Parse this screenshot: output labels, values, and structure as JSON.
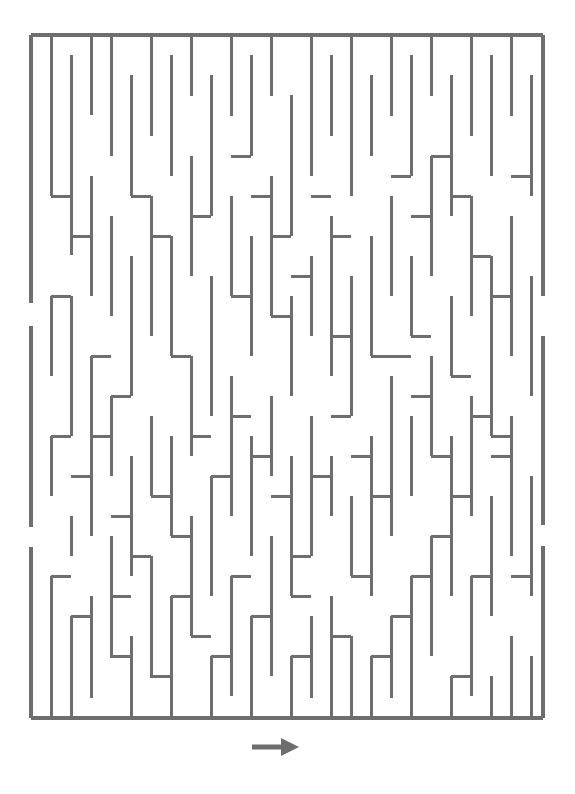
{
  "page": {
    "background_color": "#ffffff",
    "width": 575,
    "height": 794
  },
  "maze": {
    "name": "vertical-corridor-maze",
    "wall_color": "#6e6e6e",
    "wall_thickness": 3,
    "border_thickness": 4,
    "cell_size": 20,
    "columns": 26,
    "rows": 34,
    "origin_x": 31,
    "origin_y": 35,
    "width": 512,
    "height": 683,
    "border_segments": [
      {
        "name": "top-border",
        "x1": 31,
        "y1": 35,
        "x2": 543,
        "y2": 35
      },
      {
        "name": "bottom-border",
        "x1": 31,
        "y1": 718,
        "x2": 543,
        "y2": 718
      },
      {
        "name": "left-border-upper",
        "x1": 31,
        "y1": 35,
        "x2": 31,
        "y2": 303
      },
      {
        "name": "left-border-middle",
        "x1": 31,
        "y1": 326,
        "x2": 31,
        "y2": 527
      },
      {
        "name": "left-border-lower",
        "x1": 31,
        "y1": 547,
        "x2": 31,
        "y2": 718
      },
      {
        "name": "right-border-upper",
        "x1": 543,
        "y1": 35,
        "x2": 543,
        "y2": 296
      },
      {
        "name": "right-border-middle",
        "x1": 543,
        "y1": 336,
        "x2": 543,
        "y2": 525
      },
      {
        "name": "right-border-lower",
        "x1": 543,
        "y1": 546,
        "x2": 543,
        "y2": 718
      }
    ],
    "vertical_walls": [
      [
        51,
        35,
        51,
        196
      ],
      [
        51,
        296,
        51,
        376
      ],
      [
        51,
        436,
        51,
        496
      ],
      [
        51,
        576,
        51,
        718
      ],
      [
        71,
        55,
        71,
        255
      ],
      [
        71,
        296,
        71,
        436
      ],
      [
        71,
        516,
        71,
        556
      ],
      [
        71,
        616,
        71,
        718
      ],
      [
        91,
        35,
        91,
        115
      ],
      [
        91,
        176,
        91,
        296
      ],
      [
        91,
        356,
        91,
        536
      ],
      [
        91,
        596,
        91,
        698
      ],
      [
        111,
        35,
        111,
        156
      ],
      [
        111,
        216,
        111,
        316
      ],
      [
        111,
        396,
        111,
        476
      ],
      [
        111,
        536,
        111,
        658
      ],
      [
        131,
        75,
        131,
        196
      ],
      [
        131,
        256,
        131,
        396
      ],
      [
        131,
        456,
        131,
        576
      ],
      [
        131,
        636,
        131,
        718
      ],
      [
        151,
        35,
        151,
        136
      ],
      [
        151,
        196,
        151,
        336
      ],
      [
        151,
        416,
        151,
        496
      ],
      [
        151,
        556,
        151,
        678
      ],
      [
        171,
        55,
        171,
        176
      ],
      [
        171,
        236,
        171,
        356
      ],
      [
        171,
        436,
        171,
        536
      ],
      [
        171,
        596,
        171,
        718
      ],
      [
        191,
        35,
        191,
        96
      ],
      [
        191,
        156,
        191,
        276
      ],
      [
        191,
        356,
        191,
        456
      ],
      [
        191,
        516,
        191,
        636
      ],
      [
        211,
        75,
        211,
        216
      ],
      [
        211,
        276,
        211,
        416
      ],
      [
        211,
        476,
        211,
        596
      ],
      [
        211,
        656,
        211,
        718
      ],
      [
        231,
        35,
        231,
        116
      ],
      [
        231,
        196,
        231,
        296
      ],
      [
        231,
        376,
        231,
        516
      ],
      [
        231,
        576,
        231,
        696
      ],
      [
        251,
        55,
        251,
        156
      ],
      [
        251,
        236,
        251,
        356
      ],
      [
        251,
        436,
        251,
        556
      ],
      [
        251,
        616,
        251,
        718
      ],
      [
        271,
        35,
        271,
        96
      ],
      [
        271,
        176,
        271,
        316
      ],
      [
        271,
        396,
        271,
        476
      ],
      [
        271,
        536,
        271,
        676
      ],
      [
        291,
        95,
        291,
        236
      ],
      [
        291,
        296,
        291,
        396
      ],
      [
        291,
        456,
        291,
        596
      ],
      [
        291,
        656,
        291,
        718
      ],
      [
        311,
        35,
        311,
        176
      ],
      [
        311,
        256,
        311,
        336
      ],
      [
        311,
        416,
        311,
        556
      ],
      [
        311,
        616,
        311,
        698
      ],
      [
        331,
        55,
        331,
        136
      ],
      [
        331,
        216,
        331,
        376
      ],
      [
        331,
        456,
        331,
        516
      ],
      [
        331,
        596,
        331,
        718
      ],
      [
        351,
        35,
        351,
        196
      ],
      [
        351,
        276,
        351,
        416
      ],
      [
        351,
        496,
        351,
        576
      ],
      [
        351,
        636,
        351,
        718
      ],
      [
        371,
        75,
        371,
        156
      ],
      [
        371,
        236,
        371,
        356
      ],
      [
        371,
        436,
        371,
        596
      ],
      [
        371,
        656,
        371,
        718
      ],
      [
        391,
        35,
        391,
        116
      ],
      [
        391,
        196,
        391,
        296
      ],
      [
        391,
        376,
        391,
        536
      ],
      [
        391,
        616,
        391,
        698
      ],
      [
        411,
        55,
        411,
        176
      ],
      [
        411,
        256,
        411,
        336
      ],
      [
        411,
        416,
        411,
        496
      ],
      [
        411,
        576,
        411,
        718
      ],
      [
        431,
        35,
        431,
        96
      ],
      [
        431,
        156,
        431,
        276
      ],
      [
        431,
        356,
        431,
        456
      ],
      [
        431,
        536,
        431,
        656
      ],
      [
        451,
        75,
        451,
        216
      ],
      [
        451,
        296,
        451,
        376
      ],
      [
        451,
        436,
        451,
        596
      ],
      [
        451,
        676,
        451,
        718
      ],
      [
        471,
        35,
        471,
        136
      ],
      [
        471,
        196,
        471,
        316
      ],
      [
        471,
        396,
        471,
        516
      ],
      [
        471,
        576,
        471,
        696
      ],
      [
        491,
        55,
        491,
        176
      ],
      [
        491,
        256,
        491,
        436
      ],
      [
        491,
        496,
        491,
        616
      ],
      [
        491,
        676,
        491,
        718
      ],
      [
        511,
        35,
        511,
        116
      ],
      [
        511,
        216,
        511,
        356
      ],
      [
        511,
        416,
        511,
        556
      ],
      [
        511,
        636,
        511,
        718
      ],
      [
        531,
        75,
        531,
        196
      ],
      [
        531,
        276,
        531,
        396
      ],
      [
        531,
        476,
        531,
        596
      ],
      [
        531,
        656,
        531,
        718
      ]
    ],
    "horizontal_walls": [
      [
        51,
        196,
        71,
        196
      ],
      [
        71,
        236,
        91,
        236
      ],
      [
        131,
        196,
        151,
        196
      ],
      [
        151,
        236,
        171,
        236
      ],
      [
        191,
        216,
        211,
        216
      ],
      [
        231,
        156,
        251,
        156
      ],
      [
        251,
        196,
        271,
        196
      ],
      [
        271,
        236,
        291,
        236
      ],
      [
        291,
        276,
        311,
        276
      ],
      [
        311,
        196,
        331,
        196
      ],
      [
        331,
        236,
        351,
        236
      ],
      [
        391,
        176,
        411,
        176
      ],
      [
        411,
        216,
        431,
        216
      ],
      [
        431,
        156,
        451,
        156
      ],
      [
        451,
        196,
        471,
        196
      ],
      [
        471,
        256,
        491,
        256
      ],
      [
        491,
        296,
        511,
        296
      ],
      [
        511,
        176,
        531,
        176
      ],
      [
        51,
        436,
        71,
        436
      ],
      [
        71,
        476,
        91,
        476
      ],
      [
        91,
        436,
        111,
        436
      ],
      [
        111,
        516,
        131,
        516
      ],
      [
        131,
        556,
        151,
        556
      ],
      [
        151,
        496,
        171,
        496
      ],
      [
        171,
        536,
        191,
        536
      ],
      [
        191,
        436,
        211,
        436
      ],
      [
        211,
        476,
        231,
        476
      ],
      [
        231,
        416,
        251,
        416
      ],
      [
        251,
        456,
        271,
        456
      ],
      [
        271,
        496,
        291,
        496
      ],
      [
        291,
        556,
        311,
        556
      ],
      [
        311,
        476,
        331,
        476
      ],
      [
        331,
        416,
        351,
        416
      ],
      [
        351,
        456,
        371,
        456
      ],
      [
        371,
        496,
        391,
        496
      ],
      [
        391,
        356,
        411,
        356
      ],
      [
        411,
        396,
        431,
        396
      ],
      [
        431,
        456,
        451,
        456
      ],
      [
        451,
        496,
        471,
        496
      ],
      [
        471,
        416,
        491,
        416
      ],
      [
        491,
        456,
        511,
        456
      ],
      [
        511,
        576,
        531,
        576
      ],
      [
        51,
        296,
        71,
        296
      ],
      [
        91,
        356,
        111,
        356
      ],
      [
        111,
        396,
        131,
        396
      ],
      [
        171,
        356,
        191,
        356
      ],
      [
        231,
        296,
        251,
        296
      ],
      [
        271,
        316,
        291,
        316
      ],
      [
        331,
        336,
        351,
        336
      ],
      [
        371,
        356,
        391,
        356
      ],
      [
        411,
        336,
        431,
        336
      ],
      [
        451,
        376,
        471,
        376
      ],
      [
        491,
        436,
        511,
        436
      ],
      [
        71,
        616,
        91,
        616
      ],
      [
        111,
        656,
        131,
        656
      ],
      [
        151,
        676,
        171,
        676
      ],
      [
        211,
        656,
        231,
        656
      ],
      [
        251,
        616,
        271,
        616
      ],
      [
        291,
        656,
        311,
        656
      ],
      [
        331,
        636,
        351,
        636
      ],
      [
        371,
        656,
        391,
        656
      ],
      [
        411,
        576,
        431,
        576
      ],
      [
        451,
        676,
        471,
        676
      ],
      [
        111,
        596,
        131,
        596
      ],
      [
        191,
        636,
        211,
        636
      ],
      [
        291,
        596,
        311,
        596
      ],
      [
        351,
        576,
        371,
        576
      ],
      [
        431,
        536,
        451,
        536
      ],
      [
        51,
        576,
        71,
        576
      ],
      [
        171,
        596,
        191,
        596
      ],
      [
        231,
        576,
        251,
        576
      ],
      [
        391,
        616,
        411,
        616
      ],
      [
        471,
        576,
        491,
        576
      ]
    ],
    "openings": [
      {
        "name": "left-entrance-upper",
        "side": "left",
        "y": 314
      },
      {
        "name": "left-entrance-lower",
        "side": "left",
        "y": 537
      },
      {
        "name": "right-exit-upper",
        "side": "right",
        "y": 316
      },
      {
        "name": "right-exit-lower",
        "side": "right",
        "y": 535
      }
    ]
  },
  "arrow": {
    "name": "direction-arrow",
    "label": "right-arrow-icon",
    "direction": "right",
    "color": "#6e6e6e",
    "x": 252,
    "y": 747,
    "length": 45
  }
}
